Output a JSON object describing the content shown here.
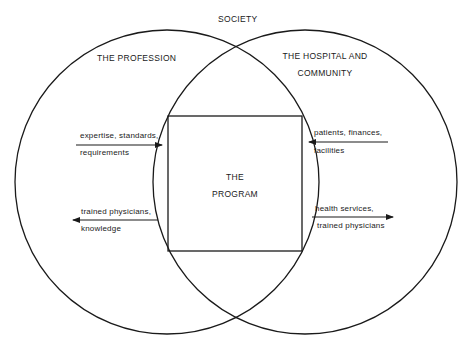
{
  "title": "SOCIETY",
  "left_circle": {
    "label": "THE PROFESSION"
  },
  "right_circle": {
    "label_line1": "THE HOSPITAL AND",
    "label_line2": "COMMUNITY"
  },
  "center_box": {
    "label_line1": "THE",
    "label_line2": "PROGRAM"
  },
  "flows": [
    {
      "line1": "expertise, standards,",
      "line2": "requirements",
      "direction": "right",
      "from": "THE PROFESSION",
      "to": "THE PROGRAM"
    },
    {
      "line1": "trained physicians,",
      "line2": "knowledge",
      "direction": "left",
      "from": "THE PROGRAM",
      "to": "THE PROFESSION"
    },
    {
      "line1": "patients, finances,",
      "line2": "facilities",
      "direction": "left",
      "from": "THE HOSPITAL AND COMMUNITY",
      "to": "THE PROGRAM"
    },
    {
      "line1": "health services,",
      "line2": "trained physicians",
      "direction": "right",
      "from": "THE PROGRAM",
      "to": "THE HOSPITAL AND COMMUNITY"
    }
  ],
  "colors": {
    "stroke": "#1a1a1a",
    "background": "#ffffff"
  }
}
